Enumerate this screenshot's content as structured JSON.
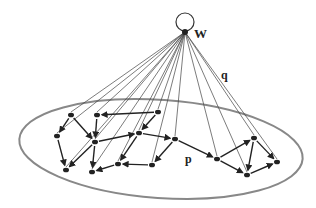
{
  "diagram": {
    "labels": {
      "hub": "W",
      "hub_edge": "q",
      "plane_edge": "p"
    },
    "hub": {
      "x": 185,
      "y": 32
    },
    "plane": {
      "cx": 161,
      "cy": 149,
      "rx": 142,
      "ry": 49,
      "rotate": 4
    },
    "nodes": [
      {
        "id": "A",
        "x": 71,
        "y": 115
      },
      {
        "id": "B",
        "x": 97,
        "y": 115
      },
      {
        "id": "C",
        "x": 158,
        "y": 112
      },
      {
        "id": "D",
        "x": 57,
        "y": 136
      },
      {
        "id": "E",
        "x": 95,
        "y": 142
      },
      {
        "id": "F",
        "x": 139,
        "y": 133
      },
      {
        "id": "G",
        "x": 175,
        "y": 139
      },
      {
        "id": "H",
        "x": 66,
        "y": 170
      },
      {
        "id": "I",
        "x": 92,
        "y": 172
      },
      {
        "id": "J",
        "x": 118,
        "y": 164
      },
      {
        "id": "K",
        "x": 152,
        "y": 165
      },
      {
        "id": "L",
        "x": 217,
        "y": 159
      },
      {
        "id": "M",
        "x": 254,
        "y": 138
      },
      {
        "id": "N",
        "x": 277,
        "y": 162
      },
      {
        "id": "O",
        "x": 247,
        "y": 175
      }
    ],
    "edges": [
      [
        "A",
        "D"
      ],
      [
        "A",
        "E"
      ],
      [
        "C",
        "B"
      ],
      [
        "C",
        "F"
      ],
      [
        "B",
        "E"
      ],
      [
        "F",
        "G"
      ],
      [
        "E",
        "F"
      ],
      [
        "D",
        "H"
      ],
      [
        "E",
        "H"
      ],
      [
        "E",
        "I"
      ],
      [
        "J",
        "I"
      ],
      [
        "K",
        "J"
      ],
      [
        "G",
        "K"
      ],
      [
        "F",
        "J"
      ],
      [
        "G",
        "L"
      ],
      [
        "L",
        "M"
      ],
      [
        "M",
        "O"
      ],
      [
        "M",
        "N"
      ],
      [
        "O",
        "N"
      ],
      [
        "L",
        "O"
      ]
    ]
  }
}
